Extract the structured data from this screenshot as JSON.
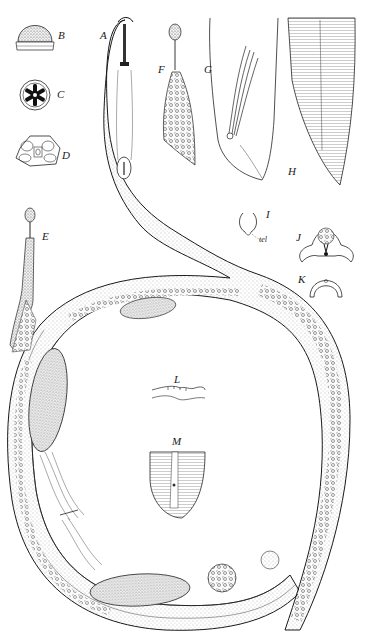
{
  "figure": {
    "type": "scientific-illustration",
    "panels": [
      {
        "id": "A",
        "label": "A",
        "desc": "anterior region, lateral view"
      },
      {
        "id": "B",
        "label": "B",
        "desc": "head, surface view"
      },
      {
        "id": "C",
        "label": "C",
        "desc": "head, en face (cross-section)"
      },
      {
        "id": "D",
        "label": "D",
        "desc": "head, en face view"
      },
      {
        "id": "E",
        "label": "E",
        "desc": "pharynx"
      },
      {
        "id": "F",
        "label": "F",
        "desc": "pharynx detail"
      },
      {
        "id": "G",
        "label": "G",
        "desc": "male tail, spicules"
      },
      {
        "id": "H",
        "label": "H",
        "desc": "tail, striated cuticle"
      },
      {
        "id": "I",
        "label": "I",
        "desc": "amphid"
      },
      {
        "id": "J",
        "label": "J",
        "desc": "cross-section"
      },
      {
        "id": "K",
        "label": "K",
        "desc": "cross-section"
      },
      {
        "id": "L",
        "label": "L",
        "desc": "cuticle profile"
      },
      {
        "id": "M",
        "label": "M",
        "desc": "tail tip, striated"
      }
    ],
    "annotations": {
      "I_abbrev": "tel"
    }
  },
  "colors": {
    "ink": "#1a1a1a",
    "stipple": "#8a8a8a",
    "background": "#ffffff"
  }
}
